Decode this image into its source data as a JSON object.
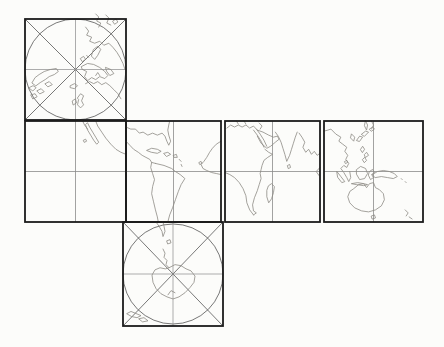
{
  "canvas": {
    "width": 444,
    "height": 347,
    "background": "#fcfcfa"
  },
  "colors": {
    "face_border": "#1b1b1b",
    "grid_line": "#8a8a8a",
    "polar_construction": "#565656",
    "coastline": "#8d8a84",
    "pole_dot": "#3a3a3a"
  },
  "map": {
    "name": "unfolded-cube-world-map",
    "description_shapes": "six cube faces of a world map unfolded into a cross",
    "faces": [
      {
        "name": "north-polar-face",
        "type": "polar",
        "x": 25,
        "y": 19,
        "w": 101,
        "h": 101,
        "coastlines": [
          "M7,63 L10,58 L14,55 L19,52 L25,50 L31,49 L33,52 L29,55 L24,57 L20,60 L15,63 L11,66 Z",
          "M4,68 L8,66 L11,68 L8,71 Z M12,71 L16,69 L19,72 L15,74 Z M6,75 L10,74 L12,77 L8,79 Z M20,64 L24,62 L27,65 L23,67 Z",
          "M45,66 L49,64 L52,66 L49,69 L45,68 Z",
          "M55,39 L58,37 L60,40 L57,42 Z M61,36 L63,38",
          "M56,47 L62,44 L68,45 L74,48 L79,52 L82,56 L79,59 L74,57 L70,60 L66,58 L62,61 L59,57 L61,52 L57,50 Z",
          "M80,48 L85,50 L88,54 L84,56 L81,52 Z",
          "M68,30 L72,27 L75,30 L72,36 L69,40 L66,37 Z",
          "M60,8 L63,12 L61,16 L66,18 L64,22 L69,24 L74,22 L78,26 L83,24 L87,28 L91,33 L94,38 L97,44 L99,50",
          "M70,-5 L73,-2 L71,2 L75,4 L73,8 M80,-4 L83,-1 L81,4 L85,6 M87,2 L90,0 L92,3 L89,5 Z",
          "M52,78 L55,74 L58,76 L56,81 L58,85 L55,88 L52,85 L53,80 Z M47,81 L50,79 L51,83 L48,85 Z",
          "M60,64 L64,62 L68,64 L72,62 L76,65 L80,63 L84,66 L88,70 L92,74 L95,79 M70,56 L72,53 L74,56"
        ]
      },
      {
        "name": "pacific-face",
        "type": "equatorial",
        "x": 25,
        "y": 121,
        "w": 101,
        "h": 101,
        "coastlines": [
          "M62,2 L64,6 L67,11 L70,16 L73,21 L71,23 L68,19 L65,14 L62,9 L60,4 Z",
          "M57,0 L59,4 L62,8",
          "M70,0 L72,5 L76,11 L80,17 L85,23 L90,28 L95,31 L100,33",
          "M58,19 L60,18 L61,20 L59,21 Z"
        ]
      },
      {
        "name": "americas-face",
        "type": "equatorial",
        "x": 126,
        "y": 121,
        "w": 95,
        "h": 101,
        "coastlines": [
          "M0,6 L5,8 L10,8 L14,12 L18,11 L23,14 L28,12 L33,14 L38,12 L41,15 L43,20 L45,24 L47,20 L45,14 L44,9 L45,4 L46,0",
          "M22,29 L27,27 L33,28 L37,30 L33,32 L27,31 Z M40,32 L44,31 L47,33 L43,35 Z M50,34 L53,33 L54,36 L51,36 Z M56,38 L58,40 M58,43 L59,45",
          "M0,20 L4,24 L8,28 L13,31 L17,34 L21,36 L25,38 L27,41 L31,42",
          "M31,42 L40,44 L48,47 L52,50 L57,53 L62,57 L58,63 L55,70 L52,78 L49,86 L46,93 L44,100",
          "M27,41 L26,46 L28,52 L30,58 L28,65 L27,72 L29,80 L31,88 L33,95 L34,100",
          "M100,20 L95,23 L91,27 L88,31 L85,36 L82,40 L79,43 L81,47 L85,49 L90,51 L95,52 L100,53",
          "M77,41 L79,40 L80,42 L78,43 Z"
        ]
      },
      {
        "name": "africa-india-face",
        "type": "equatorial",
        "x": 225,
        "y": 121,
        "w": 95,
        "h": 101,
        "coastlines": [
          "M2,7 L6,4 L10,6 L14,4 L18,6 L22,4 L26,7 L30,5 L33,8 M12,0 L14,3 M20,0 L22,3 M36,2 L39,5 L37,8",
          "M30,9 L34,14 L38,20 L41,26 M33,8 L37,13 L41,19 L44,25",
          "M34,9 L40,11 L46,14 L51,16 L55,15 L57,18 L53,21 L48,25 L44,27 L38,22 L34,15",
          "M42,28 L46,31 L50,33 L45,36 L41,39 L39,44 L38,48 L37,52 L38,57 L36,63 L34,69 L31,76 L29,83 L30,89 L33,91 L30,93",
          "M30,93 L26,88 L23,81 L22,74 L19,67 L15,61 L10,56 L5,53 L0,51",
          "M46,64 L49,62 L52,65 L51,71 L49,77 L46,81 L44,75 L44,69 Z",
          "M53,11 L56,15 L59,21 L61,27 L63,33 L65,40 L68,34 L70,28 L72,22 L74,16 L76,11 M66,44 L68,43 L69,46 L67,47 Z",
          "M78,12 L81,16 L84,21 L82,26 L85,31 L88,28 L91,33 L94,30 L97,34 L100,32 M100,46 L96,50 L99,54"
        ]
      },
      {
        "name": "asia-australia-face",
        "type": "equatorial",
        "x": 324,
        "y": 121,
        "w": 99,
        "h": 101,
        "coastlines": [
          "M42,0 L44,4 L43,9 L41,5 Z M48,0 L50,4 L48,8",
          "M33,19 L36,15 L39,16 L36,20 Z M38,13 L42,10 L45,11 L41,15 Z M46,8 L49,6 L51,8 L48,10 Z",
          "M28,13 L31,16 L30,20 L27,17 Z",
          "M0,10 L4,9 L7,8 L12,13 L17,16 L15,20 L19,23 L23,26 L21,30 L24,34 L22,38 L25,42 L23,46 L20,44 L17,47 L20,51 L23,56 L25,60 L27,56 L26,50",
          "M21,40 L23,39 L24,41 L22,42 Z",
          "M13,50 L17,55 L21,60 L18,61 L14,56 Z M28,62 L34,61 L40,62 L44,63 L40,64 L33,63 Z",
          "M37,28 L39,25 L41,28 L39,31 Z M41,33 L43,31 L45,34 L42,36 Z M39,38 L41,36 L43,39 L41,41 Z",
          "M33,48 L37,45 L42,47 L44,52 L41,57 L36,58 L33,53 Z M46,50 L49,48 L51,51 L48,53 L50,56 L47,58 L45,54 Z",
          "M49,53 L54,50 L60,49 L66,50 L71,52 L74,55 L70,57 L64,56 L58,55 L52,56 Z",
          "M30,67 L35,63 L40,62 L43,66 L46,62 L50,61 L52,66 L56,68 L60,72 L61,78 L58,84 L52,88 L45,90 L38,89 L31,86 L26,81 L24,75 L26,70 Z M48,94 L51,93 L52,96 L49,97 Z",
          "M82,88 L85,91 L83,94 M86,95 L89,97",
          "M78,57 L79,58 M82,60 L83,61"
        ]
      },
      {
        "name": "south-polar-face",
        "type": "polar",
        "x": 123,
        "y": 222,
        "w": 100,
        "h": 104,
        "coastlines": [
          "M33,0 L36,4 L39,9 L40,14 L42,9 L41,4 L40,0 M44,18 L47,17 L48,20 L45,21 Z",
          "M40,26 L42,30 L41,34 L44,37 L43,41 L46,44",
          "M46,44 L52,41 L58,42 L63,45 L68,47 L72,52 L71,58 L67,63 L62,68 L56,72 L50,74 L44,72 L38,69 L33,64 L30,58 L29,51 L32,46 L37,44 L42,45 Z M45,70 L48,66 L52,68",
          "M4,88 L8,86 L13,88 L18,90 L14,92 L9,91 Z M16,93 L21,92 L25,95 L20,96 Z"
        ]
      }
    ]
  }
}
